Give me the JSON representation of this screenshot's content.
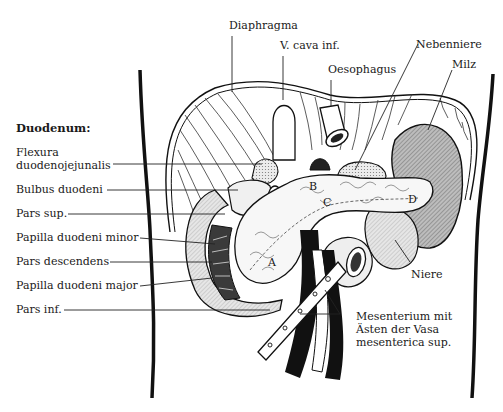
{
  "diagram": {
    "title": "Duodenum:",
    "left_labels": [
      {
        "id": "flexura",
        "text": "Flexura\nduodenojejunalis"
      },
      {
        "id": "bulbus",
        "text": "Bulbus duodeni"
      },
      {
        "id": "pars_sup",
        "text": "Pars sup."
      },
      {
        "id": "papilla_minor",
        "text": "Papilla duodeni minor"
      },
      {
        "id": "pars_descendens",
        "text": "Pars descendens"
      },
      {
        "id": "papilla_major",
        "text": "Papilla duodeni major"
      },
      {
        "id": "pars_inf",
        "text": "Pars inf."
      }
    ],
    "top_labels": [
      {
        "id": "diaphragma",
        "text": "Diaphragma"
      },
      {
        "id": "vcava",
        "text": "V. cava inf."
      },
      {
        "id": "oesophagus",
        "text": "Oesophagus"
      },
      {
        "id": "nebenniere",
        "text": "Nebenniere"
      },
      {
        "id": "milz",
        "text": "Milz"
      }
    ],
    "right_labels": [
      {
        "id": "niere",
        "text": "Niere"
      },
      {
        "id": "mesenterium",
        "text": "Mesenterium mit\nÄsten der Vasa\nmesenterica sup."
      }
    ],
    "letters": [
      "A",
      "B",
      "C",
      "D"
    ],
    "colors": {
      "ink": "#1a1a1a",
      "spleen_fill": "#9a9a9a",
      "kidney_fill": "#cfcfcf",
      "adrenal_fill": "#d8d8d8",
      "duodenum_fill": "#e4e4e4",
      "background": "#ffffff"
    }
  }
}
